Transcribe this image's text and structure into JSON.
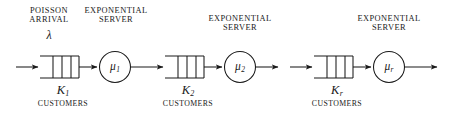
{
  "figure": {
    "type": "tandem-queueing-network",
    "stage_count_shown": 3,
    "background_color": "#ffffff",
    "stroke_color": "#1a1a1a"
  },
  "arrival": {
    "caption_line1": "POISSON",
    "caption_line2": "ARRIVAL",
    "rate_symbol": "λ"
  },
  "stages": [
    {
      "id": "stage-1",
      "server_caption_line1": "EXPONENTIAL",
      "server_caption_line2": "SERVER",
      "service_rate": "μ",
      "service_rate_index": "1",
      "capacity_symbol": "K",
      "capacity_index": "1",
      "capacity_caption": "CUSTOMERS",
      "queue_slots": 4
    },
    {
      "id": "stage-2",
      "server_caption_line1": "EXPONENTIAL",
      "server_caption_line2": "SERVER",
      "service_rate": "μ",
      "service_rate_index": "2",
      "capacity_symbol": "K",
      "capacity_index": "2",
      "capacity_caption": "CUSTOMERS",
      "queue_slots": 4
    },
    {
      "id": "stage-r",
      "server_caption_line1": "EXPONENTIAL",
      "server_caption_line2": "SERVER",
      "service_rate": "μ",
      "service_rate_index": "r",
      "capacity_symbol": "K",
      "capacity_index": "r",
      "capacity_caption": "CUSTOMERS",
      "queue_slots": 4
    }
  ]
}
